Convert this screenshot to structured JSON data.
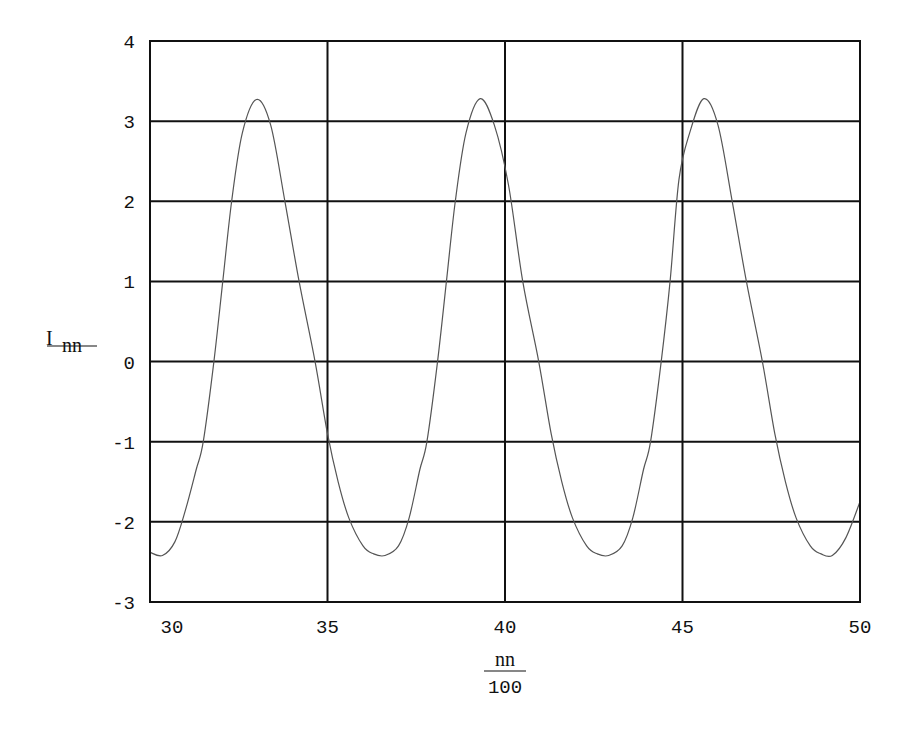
{
  "chart_data": {
    "type": "line",
    "title": "",
    "xlabel": "nn/100",
    "xlabel_numerator": "nn",
    "xlabel_denominator": "100",
    "ylabel": "I_nn",
    "ylabel_main": "I",
    "ylabel_sub": "nn",
    "xlim": [
      30,
      50
    ],
    "ylim": [
      -3,
      4
    ],
    "grid": true,
    "legend": null,
    "x_ticks": [
      30,
      35,
      40,
      45,
      50
    ],
    "x_tick_labels": [
      "30",
      "35",
      "40",
      "45",
      "50"
    ],
    "y_ticks": [
      -3,
      -2,
      -1,
      0,
      1,
      2,
      3,
      4
    ],
    "y_tick_labels": [
      "-3",
      "-2",
      "-1",
      "0",
      "1",
      "2",
      "3",
      "4"
    ],
    "line_color": "#555555",
    "grid_color": "#111111",
    "series": [
      {
        "name": "I_nn",
        "x": [
          30.0,
          30.35,
          30.7,
          31.0,
          31.3,
          31.5,
          31.8,
          32.05,
          32.3,
          32.6,
          33.0,
          33.4,
          33.8,
          34.2,
          34.65,
          35.0,
          35.3,
          35.6,
          36.0,
          36.3,
          36.62,
          37.0,
          37.3,
          37.6,
          37.8,
          38.1,
          38.35,
          38.6,
          38.9,
          39.3,
          39.7,
          40.1,
          40.5,
          40.95,
          41.3,
          41.6,
          41.9,
          42.3,
          42.6,
          42.92,
          43.3,
          43.6,
          43.9,
          44.1,
          44.4,
          44.65,
          44.9,
          45.2,
          45.6,
          46.0,
          46.4,
          46.8,
          47.25,
          47.6,
          47.9,
          48.2,
          48.6,
          48.9,
          49.22,
          49.6,
          50.0
        ],
        "y": [
          -2.38,
          -2.42,
          -2.25,
          -1.85,
          -1.35,
          -1.0,
          0.0,
          1.0,
          2.0,
          2.85,
          3.27,
          2.95,
          2.0,
          1.0,
          0.0,
          -0.9,
          -1.5,
          -1.95,
          -2.3,
          -2.4,
          -2.42,
          -2.3,
          -1.95,
          -1.35,
          -1.0,
          0.0,
          1.0,
          2.0,
          2.85,
          3.28,
          2.95,
          2.2,
          1.0,
          0.0,
          -0.9,
          -1.5,
          -1.95,
          -2.3,
          -2.4,
          -2.42,
          -2.3,
          -1.95,
          -1.35,
          -1.0,
          0.0,
          1.0,
          2.27,
          2.85,
          3.28,
          2.95,
          2.0,
          1.0,
          0.0,
          -0.9,
          -1.5,
          -1.95,
          -2.3,
          -2.4,
          -2.42,
          -2.2,
          -1.75
        ]
      }
    ]
  }
}
